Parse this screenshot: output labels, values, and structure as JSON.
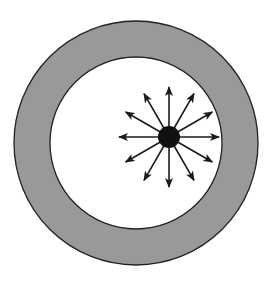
{
  "diagram": {
    "canvas": {
      "width": 270,
      "height": 281,
      "background": "#ffffff"
    },
    "ring": {
      "center": [
        136,
        143
      ],
      "outer_radius": 122,
      "inner_radius": 86,
      "fill": "#999999",
      "stroke": "#222222"
    },
    "source": {
      "center": [
        169,
        137
      ],
      "radius": 11,
      "fill": "#111111"
    },
    "arrows": {
      "count": 12,
      "angle_step_deg": 30,
      "length": 50,
      "color": "#1a1a1a"
    }
  }
}
